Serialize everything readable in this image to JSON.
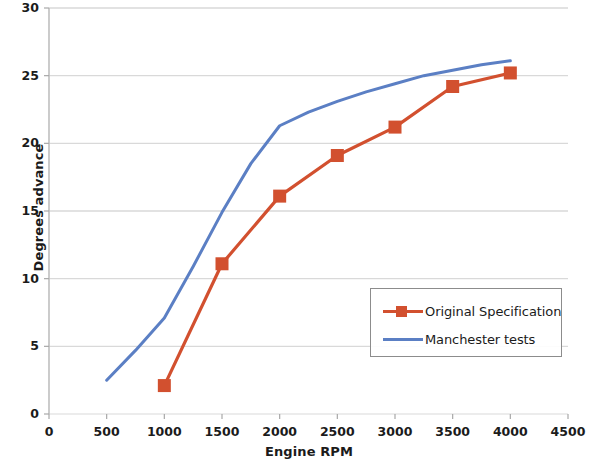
{
  "chart_data": {
    "type": "line",
    "title": "",
    "xlabel": "Engine RPM",
    "ylabel": "Degrees advance",
    "xlim": [
      0,
      4500
    ],
    "ylim": [
      0,
      30
    ],
    "xticks": [
      0,
      500,
      1000,
      1500,
      2000,
      2500,
      3000,
      3500,
      4000,
      4500
    ],
    "yticks": [
      0,
      5,
      10,
      15,
      20,
      25,
      30
    ],
    "grid": "horizontal",
    "legend_position": "lower-right-inside",
    "series": [
      {
        "name": "Original Specification",
        "color": "#D2502F",
        "marker": "square",
        "x": [
          1000,
          1500,
          2000,
          2500,
          3000,
          3500,
          4000
        ],
        "values": [
          2.1,
          11.1,
          16.1,
          19.1,
          21.2,
          24.2,
          25.2
        ]
      },
      {
        "name": "Manchester tests",
        "color": "#5B7FC4",
        "marker": "none",
        "x": [
          500,
          750,
          1000,
          1250,
          1500,
          1750,
          2000,
          2250,
          2500,
          2750,
          3000,
          3250,
          3500,
          3750,
          4000
        ],
        "values": [
          2.5,
          4.7,
          7.1,
          10.9,
          14.9,
          18.5,
          21.3,
          22.3,
          23.1,
          23.8,
          24.4,
          25.0,
          25.4,
          25.8,
          26.1
        ]
      }
    ]
  },
  "axes": {
    "y_tick_labels": [
      "0",
      "5",
      "10",
      "15",
      "20",
      "25",
      "30"
    ],
    "x_tick_labels": [
      "0",
      "500",
      "1000",
      "1500",
      "2000",
      "2500",
      "3000",
      "3500",
      "4000",
      "4500"
    ],
    "y_title": "Degrees advance",
    "x_title": "Engine RPM"
  },
  "legend": {
    "items": [
      {
        "label": "Original Specification",
        "color": "#D2502F",
        "marker": "square"
      },
      {
        "label": "Manchester tests",
        "color": "#5B7FC4",
        "marker": "none"
      }
    ]
  },
  "colors": {
    "series_original": "#D2502F",
    "series_manchester": "#5B7FC4",
    "grid": "#d9d9d9",
    "axis": "#c9c9c9",
    "text": "#1b1b1b"
  }
}
